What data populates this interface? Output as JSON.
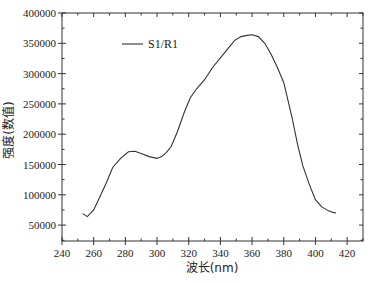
{
  "chart_data": {
    "type": "line",
    "title": "",
    "xlabel": "波长(nm)",
    "ylabel": "强度(数值)",
    "xlim": [
      240,
      430
    ],
    "ylim": [
      23500,
      400000
    ],
    "x_ticks": [
      240,
      260,
      280,
      300,
      320,
      340,
      360,
      380,
      400,
      420
    ],
    "y_ticks": [
      50000,
      100000,
      150000,
      200000,
      250000,
      300000,
      350000,
      400000
    ],
    "grid": false,
    "legend_position": "upper-left",
    "series": [
      {
        "name": "S1/R1",
        "color": "#333333",
        "x": [
          253,
          256,
          260,
          264,
          268,
          272,
          277,
          282,
          286,
          290,
          295,
          300,
          303,
          306,
          309,
          313,
          317,
          321,
          325,
          330,
          335,
          340,
          345,
          349,
          353,
          357,
          360,
          364,
          368,
          372,
          376,
          380,
          385,
          389,
          392,
          396,
          400,
          404,
          408,
          411,
          413
        ],
        "values": [
          69000,
          64000,
          75000,
          97000,
          120000,
          145000,
          160000,
          171000,
          172000,
          168000,
          163000,
          160000,
          163000,
          170000,
          180000,
          205000,
          235000,
          260000,
          275000,
          290000,
          310000,
          326000,
          342000,
          355000,
          361000,
          363000,
          364000,
          361000,
          350000,
          332000,
          310000,
          285000,
          230000,
          180000,
          148000,
          118000,
          92000,
          80000,
          74000,
          71000,
          70000
        ]
      }
    ]
  }
}
